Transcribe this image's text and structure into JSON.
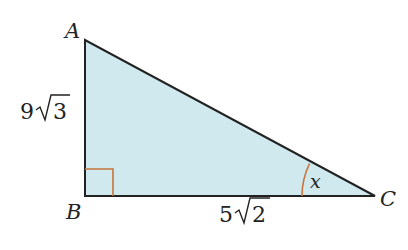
{
  "diagram": {
    "type": "right-triangle",
    "vertices": {
      "A": {
        "label": "A"
      },
      "B": {
        "label": "B"
      },
      "C": {
        "label": "C"
      }
    },
    "sides": {
      "AB": {
        "coef": "9",
        "radicand": "3"
      },
      "BC": {
        "coef": "5",
        "radicand": "2"
      }
    },
    "angle": {
      "at": "C",
      "label": "x"
    },
    "right_angle_at": "B",
    "colors": {
      "fill": "#cfe9ef",
      "stroke": "#222222",
      "marker": "#c8743a"
    }
  }
}
